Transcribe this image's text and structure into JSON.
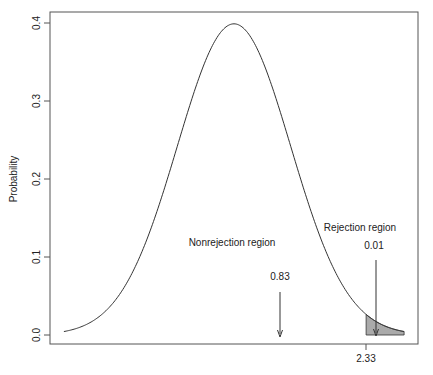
{
  "chart_data": {
    "type": "area",
    "title": "",
    "xlabel": "",
    "ylabel": "Probability",
    "ylim": [
      0.0,
      0.4
    ],
    "xlim": [
      -3.0,
      3.0
    ],
    "y_ticks": [
      "0.0",
      "0.1",
      "0.2",
      "0.3",
      "0.4"
    ],
    "x_ticks": [
      "2.33"
    ],
    "grid": false,
    "legend": null,
    "series": [
      {
        "name": "Standard normal density",
        "mean": 0,
        "sd": 1,
        "peak": 0.399
      }
    ],
    "shaded_region": {
      "from": 2.33,
      "to": 3.0,
      "color": "#aaaaaa"
    },
    "annotations": [
      {
        "text": "Nonrejection region",
        "value": "0.83"
      },
      {
        "text": "Rejection region",
        "value": "0.01"
      }
    ]
  },
  "labels": {
    "ylabel": "Probability",
    "y_ticks": [
      "0.0",
      "0.1",
      "0.2",
      "0.3",
      "0.4"
    ],
    "x_tick": "2.33",
    "nonrejection": "Nonrejection region",
    "nonrejection_value": "0.83",
    "rejection": "Rejection region",
    "rejection_value": "0.01"
  }
}
